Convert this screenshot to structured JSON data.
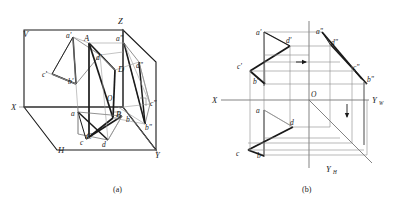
{
  "figure": {
    "type": "descriptive-geometry-projection",
    "captions": [
      {
        "id": "a",
        "text": "(a)",
        "x": 118,
        "y": 190
      },
      {
        "id": "b",
        "text": "(b)",
        "x": 307,
        "y": 190
      }
    ]
  },
  "panel_a": {
    "name": "three-dimensional-projection-box",
    "description": "Quadrilateral ABCD inside V-H-W projection box with projections onto V, H and W planes",
    "plane_labels": [
      {
        "id": "V",
        "text": "V",
        "x": 23,
        "y": 37
      },
      {
        "id": "H",
        "text": "H",
        "x": 58,
        "y": 153
      },
      {
        "id": "X",
        "text": "X",
        "x": 11,
        "y": 107
      },
      {
        "id": "Y",
        "text": "Y",
        "x": 155,
        "y": 158
      },
      {
        "id": "Z",
        "text": "Z",
        "x": 118,
        "y": 24
      },
      {
        "id": "O",
        "text": "O",
        "x": 107,
        "y": 101
      }
    ],
    "space_points": [
      {
        "id": "A",
        "text": "A",
        "x": 84,
        "y": 41
      },
      {
        "id": "B",
        "text": "B",
        "x": 116,
        "y": 117
      },
      {
        "id": "C",
        "text": "C",
        "x": 86,
        "y": 139
      },
      {
        "id": "D",
        "text": "D",
        "x": 118,
        "y": 72
      }
    ],
    "v_projection_points": [
      {
        "id": "a'",
        "text": "a'",
        "x": 69,
        "y": 39
      },
      {
        "id": "b'",
        "text": "b'",
        "x": 71,
        "y": 82
      },
      {
        "id": "c'",
        "text": "c'",
        "x": 47,
        "y": 76
      },
      {
        "id": "d'",
        "text": "d'",
        "x": 99,
        "y": 59
      }
    ],
    "h_projection_points": [
      {
        "id": "a",
        "text": "a",
        "x": 74,
        "y": 114
      },
      {
        "id": "b",
        "text": "b",
        "x": 126,
        "y": 118
      },
      {
        "id": "c",
        "text": "c",
        "x": 83,
        "y": 141
      },
      {
        "id": "d",
        "text": "d",
        "x": 103,
        "y": 143
      }
    ],
    "w_projection_points": [
      {
        "id": "a\"",
        "text": "a\"",
        "x": 118,
        "y": 41
      },
      {
        "id": "b\"",
        "text": "b\"",
        "x": 147,
        "y": 126
      },
      {
        "id": "c\"",
        "text": "c\"",
        "x": 152,
        "y": 104
      },
      {
        "id": "d\"",
        "text": "d\"",
        "x": 140,
        "y": 68
      }
    ]
  },
  "panel_b": {
    "name": "orthographic-three-view-projection",
    "description": "Front (V), top (H) and side (W) views of quadrilateral ABCD with projection lines",
    "axis_labels": [
      {
        "id": "X",
        "text": "X",
        "x": 214,
        "y": 104
      },
      {
        "id": "Yw",
        "text": "Y",
        "sub": "W",
        "x": 373,
        "y": 103
      },
      {
        "id": "Yh",
        "text": "Y",
        "sub": "H",
        "x": 328,
        "y": 170
      },
      {
        "id": "O",
        "text": "O",
        "x": 311,
        "y": 96
      }
    ],
    "v_view_points": [
      {
        "id": "a'",
        "text": "a'",
        "x": 260,
        "y": 35
      },
      {
        "id": "d'",
        "text": "d'",
        "x": 290,
        "y": 43
      },
      {
        "id": "c'",
        "text": "c'",
        "x": 241,
        "y": 68
      },
      {
        "id": "b'",
        "text": "b'",
        "x": 259,
        "y": 83
      }
    ],
    "w_view_points": [
      {
        "id": "a\"",
        "text": "a\"",
        "x": 318,
        "y": 34
      },
      {
        "id": "d\"",
        "text": "d\"",
        "x": 333,
        "y": 43
      },
      {
        "id": "c\"",
        "text": "c\"",
        "x": 355,
        "y": 68
      },
      {
        "id": "b\"",
        "text": "b\"",
        "x": 364,
        "y": 81
      }
    ],
    "h_view_points": [
      {
        "id": "a",
        "text": "a",
        "x": 260,
        "y": 110
      },
      {
        "id": "d",
        "text": "d",
        "x": 292,
        "y": 123
      },
      {
        "id": "c",
        "text": "c",
        "x": 240,
        "y": 153
      },
      {
        "id": "b",
        "text": "b",
        "x": 261,
        "y": 154
      }
    ],
    "direction_arrows": [
      {
        "id": "horizontal-arrow",
        "direction": "right",
        "x": 302,
        "y": 62
      },
      {
        "id": "vertical-arrow",
        "direction": "down",
        "x": 347,
        "y": 115
      }
    ]
  },
  "colors": {
    "ink": "#1a1a1a",
    "thin_line": "#8a8a8a",
    "background": "#ffffff"
  }
}
